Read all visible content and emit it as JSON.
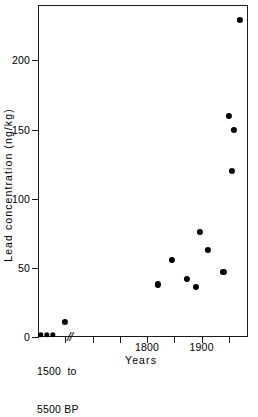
{
  "chart_data": {
    "type": "scatter",
    "title": "",
    "xlabel": "Years",
    "ylabel": "Lead  concentration  (ng/kg)",
    "ylim": [
      0,
      240
    ],
    "yticks": [
      0,
      50,
      100,
      150,
      200
    ],
    "xlim": [
      1600,
      1985
    ],
    "xticks": [
      1650,
      1700,
      1750,
      1800,
      1850,
      1900,
      1950
    ],
    "xtick_labels": [
      "",
      "",
      "",
      "1800",
      "",
      "1900",
      ""
    ],
    "grid": false,
    "legend": null,
    "axis_break": {
      "symbol": "//",
      "label_line1": "1500  to",
      "label_line2": "5500 BP",
      "note": "x-axis is broken; leftmost group is an ancient reference interval"
    },
    "series": [
      {
        "name": "Ancient reference samples",
        "marker": "filled-circle",
        "color": "#000000",
        "category": "1500 to 5500 BP",
        "points": [
          {
            "x": null,
            "y": 1.5,
            "px": 41
          },
          {
            "x": null,
            "y": 1.5,
            "px": 47
          },
          {
            "x": null,
            "y": 1.5,
            "px": 53
          }
        ]
      },
      {
        "name": "Dated ice-core samples",
        "marker": "filled-circle",
        "color": "#000000",
        "points": [
          {
            "x": 1650,
            "y": 11
          },
          {
            "x": 1820,
            "y": 38
          },
          {
            "x": 1845,
            "y": 56
          },
          {
            "x": 1873,
            "y": 42
          },
          {
            "x": 1890,
            "y": 36
          },
          {
            "x": 1897,
            "y": 76
          },
          {
            "x": 1912,
            "y": 63
          },
          {
            "x": 1940,
            "y": 47
          },
          {
            "x": 1950,
            "y": 160
          },
          {
            "x": 1956,
            "y": 120
          },
          {
            "x": 1959,
            "y": 150
          },
          {
            "x": 1970,
            "y": 229
          }
        ]
      }
    ]
  }
}
